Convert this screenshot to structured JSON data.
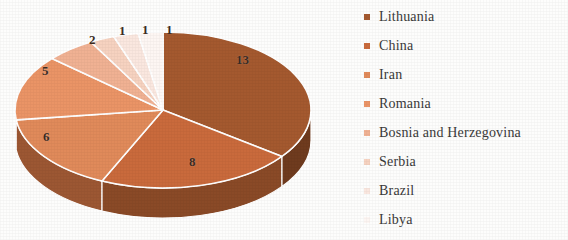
{
  "chart_data": {
    "type": "pie",
    "title": "",
    "subtitle": "",
    "xlabel": "",
    "ylabel": "",
    "legend_position": "right",
    "grid": false,
    "three_d": true,
    "total": 37,
    "categories": [
      "Lithuania",
      "China",
      "Iran",
      "Romania",
      "Bosnia and Herzegovina",
      "Serbia",
      "Brazil",
      "Libya"
    ],
    "values": [
      13,
      8,
      6,
      5,
      2,
      1,
      1,
      1
    ],
    "data_labels": [
      "13",
      "8",
      "6",
      "5",
      "2",
      "1",
      "1",
      "1"
    ],
    "colors": [
      "#a4592f",
      "#c96a3c",
      "#e08a5a",
      "#ea9466",
      "#f0b193",
      "#f6d2c0",
      "#fae7df",
      "#fdf6f3"
    ],
    "side_colors": [
      "#6f3b1e",
      "#8a4a27",
      "#9c5733",
      "#a45c37",
      "#b07a58",
      "#c09483",
      "#cfa99b",
      "#dbbcb0"
    ]
  },
  "legend": {
    "items": [
      {
        "label": "Lithuania",
        "color": "#a4592f"
      },
      {
        "label": "China",
        "color": "#c96a3c"
      },
      {
        "label": "Iran",
        "color": "#e08a5a"
      },
      {
        "label": "Romania",
        "color": "#ea9466"
      },
      {
        "label": "Bosnia and Herzegovina",
        "color": "#f0b193"
      },
      {
        "label": "Serbia",
        "color": "#f6d2c0"
      },
      {
        "label": "Brazil",
        "color": "#fae7df"
      },
      {
        "label": "Libya",
        "color": "#fdf6f3"
      }
    ]
  },
  "labels": {
    "l0": "13",
    "l1": "8",
    "l2": "6",
    "l3": "5",
    "l4": "2",
    "l5": "1",
    "l6": "1",
    "l7": "1"
  }
}
